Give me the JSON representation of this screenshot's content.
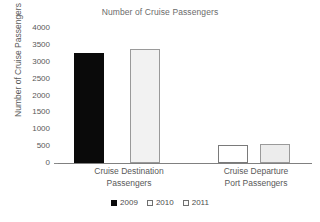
{
  "chart_data": {
    "type": "bar",
    "title": "Number of Cruise Passengers",
    "xlabel": "",
    "ylabel": "Number of Cruise Passengers",
    "ylim": [
      0,
      4000
    ],
    "yticks": [
      0,
      500,
      1000,
      1500,
      2000,
      2500,
      3000,
      3500,
      4000
    ],
    "grid": false,
    "legend_position": "bottom",
    "categories": [
      "Cruise Destination Passengers",
      "Cruise Departure Port Passengers"
    ],
    "category_lines": [
      [
        "Cruise Destination",
        "Passengers"
      ],
      [
        "Cruise Departure",
        "Port Passengers"
      ]
    ],
    "series": [
      {
        "name": "2009",
        "values": [
          3270,
          null
        ]
      },
      {
        "name": "2010",
        "values": [
          3380,
          540
        ]
      },
      {
        "name": "2011",
        "values": [
          null,
          550
        ]
      }
    ],
    "bars": [
      {
        "group": 0,
        "series": "2009",
        "value": 3270,
        "style": "s2009"
      },
      {
        "group": 0,
        "series": "2010",
        "value": 3380,
        "style": "s2010"
      },
      {
        "group": 1,
        "series": "2010",
        "value": 540,
        "style": "s2011"
      },
      {
        "group": 1,
        "series": "2011",
        "value": 550,
        "style": "s2011alt"
      }
    ],
    "legend": [
      {
        "label": "2009",
        "swatch": "k2009",
        "color": "#0a0a0a"
      },
      {
        "label": "2010",
        "swatch": "k2010",
        "color": "#fafafa"
      },
      {
        "label": "2011",
        "swatch": "k2011",
        "color": "#fafafa"
      }
    ],
    "colors": {
      "axis": "#808080",
      "text": "#595959",
      "title": "#6b6b6b",
      "series_2009": "#0a0a0a",
      "series_2010": "#f2f2f2",
      "series_2011": "#ffffff"
    }
  }
}
